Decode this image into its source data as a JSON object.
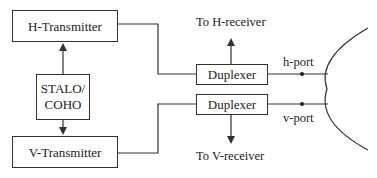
{
  "diagram": {
    "type": "block-diagram",
    "blocks": {
      "h_transmitter": "H-Transmitter",
      "v_transmitter": "V-Transmitter",
      "stalo_line1": "STALO/",
      "stalo_line2": "COHO",
      "duplexer_h": "Duplexer",
      "duplexer_v": "Duplexer"
    },
    "labels": {
      "to_h_receiver": "To H-receiver",
      "to_v_receiver": "To V-receiver",
      "h_port": "h-port",
      "v_port": "v-port"
    },
    "connections": [
      {
        "from": "STALO/COHO",
        "to": "H-Transmitter",
        "arrow": true
      },
      {
        "from": "STALO/COHO",
        "to": "V-Transmitter",
        "arrow": true
      },
      {
        "from": "H-Transmitter",
        "to": "Duplexer (H)",
        "arrow": false
      },
      {
        "from": "V-Transmitter",
        "to": "Duplexer (V)",
        "arrow": false
      },
      {
        "from": "Duplexer (H)",
        "to": "To H-receiver",
        "arrow": true
      },
      {
        "from": "Duplexer (V)",
        "to": "To V-receiver",
        "arrow": true
      },
      {
        "from": "Duplexer (H)",
        "to": "Antenna (h-port)",
        "arrow": false
      },
      {
        "from": "Duplexer (V)",
        "to": "Antenna (v-port)",
        "arrow": false
      }
    ],
    "colors": {
      "line": "#333333",
      "text": "#222222",
      "background": "#ffffff"
    }
  }
}
